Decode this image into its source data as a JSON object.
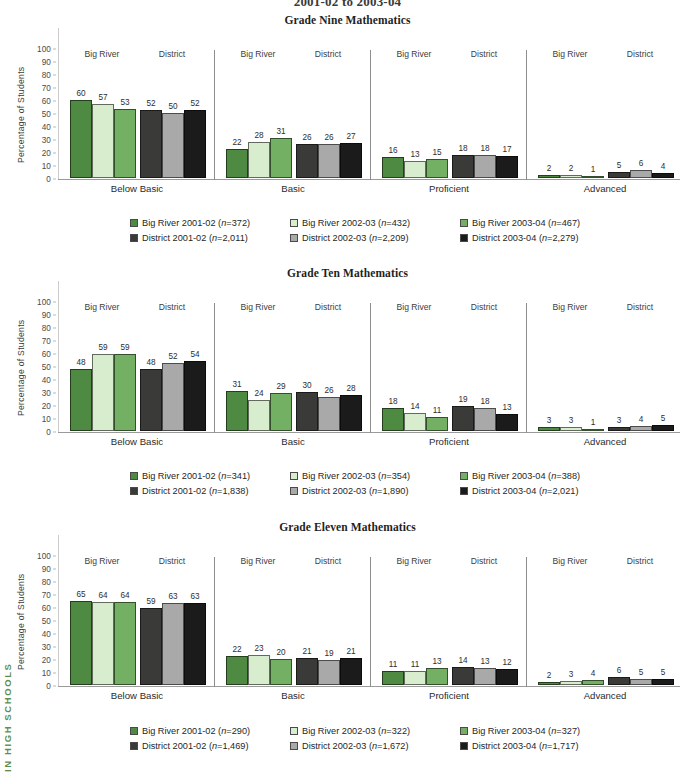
{
  "page": {
    "top_title": "2001-02 to 2003-04",
    "running_head": "IN HIGH SCHOOLS"
  },
  "series_defs": [
    {
      "key": "br0102",
      "label_prefix": "Big River 2001-02",
      "color": "#4e8a42"
    },
    {
      "key": "br0203",
      "label_prefix": "Big River 2002-03",
      "color": "#d8ecce"
    },
    {
      "key": "br0304",
      "label_prefix": "Big River 2003-04",
      "color": "#74b063"
    },
    {
      "key": "d0102",
      "label_prefix": "District 2001-02",
      "color": "#3a3a38"
    },
    {
      "key": "d0203",
      "label_prefix": "District 2002-03",
      "color": "#a9a9a9"
    },
    {
      "key": "d0304",
      "label_prefix": "District 2003-04",
      "color": "#1b1b1b"
    }
  ],
  "axis": {
    "ylabel": "Percentage of Students",
    "ticks": [
      "100",
      "90",
      "80",
      "70",
      "60",
      "50",
      "40",
      "30",
      "20",
      "10",
      "0"
    ],
    "ymin": 0,
    "ymax": 100
  },
  "group_headers": {
    "big_river": "Big River",
    "district": "District"
  },
  "categories": [
    "Below Basic",
    "Basic",
    "Proficient",
    "Advanced"
  ],
  "chart_data": [
    {
      "type": "bar",
      "title": "Grade Nine Mathematics",
      "xlabel": "",
      "ylabel": "Percentage of Students",
      "ylim": [
        0,
        100
      ],
      "grid": false,
      "legend_position": "bottom",
      "categories": [
        "Below Basic",
        "Basic",
        "Proficient",
        "Advanced"
      ],
      "series": [
        {
          "name": "Big River 2001-02 (n=372)",
          "n": "372",
          "values": [
            60,
            22,
            16,
            2
          ]
        },
        {
          "name": "Big River 2002-03 (n=432)",
          "n": "432",
          "values": [
            57,
            28,
            13,
            2
          ]
        },
        {
          "name": "Big River 2003-04 (n=467)",
          "n": "467",
          "values": [
            53,
            31,
            15,
            1
          ]
        },
        {
          "name": "District 2001-02 (n=2,011)",
          "n": "2,011",
          "values": [
            52,
            26,
            18,
            5
          ]
        },
        {
          "name": "District 2002-03 (n=2,209)",
          "n": "2,209",
          "values": [
            50,
            26,
            18,
            6
          ]
        },
        {
          "name": "District 2003-04 (n=2,279)",
          "n": "2,279",
          "values": [
            52,
            27,
            17,
            4
          ]
        }
      ],
      "legend": [
        {
          "label_prefix": "Big River 2001-02",
          "n": "372",
          "color": "#4e8a42"
        },
        {
          "label_prefix": "Big River 2002-03",
          "n": "432",
          "color": "#d8ecce"
        },
        {
          "label_prefix": "Big River 2003-04",
          "n": "467",
          "color": "#74b063"
        },
        {
          "label_prefix": "District 2001-02",
          "n": "2,011",
          "color": "#3a3a38"
        },
        {
          "label_prefix": "District 2002-03",
          "n": "2,209",
          "color": "#a9a9a9"
        },
        {
          "label_prefix": "District 2003-04",
          "n": "2,279",
          "color": "#1b1b1b"
        }
      ]
    },
    {
      "type": "bar",
      "title": "Grade Ten Mathematics",
      "xlabel": "",
      "ylabel": "Percentage of Students",
      "ylim": [
        0,
        100
      ],
      "grid": false,
      "legend_position": "bottom",
      "categories": [
        "Below Basic",
        "Basic",
        "Proficient",
        "Advanced"
      ],
      "series": [
        {
          "name": "Big River 2001-02 (n=341)",
          "n": "341",
          "values": [
            48,
            31,
            18,
            3
          ]
        },
        {
          "name": "Big River 2002-03 (n=354)",
          "n": "354",
          "values": [
            59,
            24,
            14,
            3
          ]
        },
        {
          "name": "Big River 2003-04 (n=388)",
          "n": "388",
          "values": [
            59,
            29,
            11,
            1
          ]
        },
        {
          "name": "District 2001-02 (n=1,838)",
          "n": "1,838",
          "values": [
            48,
            30,
            19,
            3
          ]
        },
        {
          "name": "District 2002-03 (n=1,890)",
          "n": "1,890",
          "values": [
            52,
            26,
            18,
            4
          ]
        },
        {
          "name": "District 2003-04 (n=2,021)",
          "n": "2,021",
          "values": [
            54,
            28,
            13,
            5
          ]
        }
      ],
      "legend": [
        {
          "label_prefix": "Big River 2001-02",
          "n": "341",
          "color": "#4e8a42"
        },
        {
          "label_prefix": "Big River 2002-03",
          "n": "354",
          "color": "#d8ecce"
        },
        {
          "label_prefix": "Big River 2003-04",
          "n": "388",
          "color": "#74b063"
        },
        {
          "label_prefix": "District 2001-02",
          "n": "1,838",
          "color": "#3a3a38"
        },
        {
          "label_prefix": "District 2002-03",
          "n": "1,890",
          "color": "#a9a9a9"
        },
        {
          "label_prefix": "District 2003-04",
          "n": "2,021",
          "color": "#1b1b1b"
        }
      ]
    },
    {
      "type": "bar",
      "title": "Grade Eleven Mathematics",
      "xlabel": "",
      "ylabel": "Percentage of Students",
      "ylim": [
        0,
        100
      ],
      "grid": false,
      "legend_position": "bottom",
      "categories": [
        "Below Basic",
        "Basic",
        "Proficient",
        "Advanced"
      ],
      "series": [
        {
          "name": "Big River 2001-02 (n=290)",
          "n": "290",
          "values": [
            65,
            22,
            11,
            2
          ]
        },
        {
          "name": "Big River 2002-03 (n=322)",
          "n": "322",
          "values": [
            64,
            23,
            11,
            3
          ]
        },
        {
          "name": "Big River 2003-04 (n=327)",
          "n": "327",
          "values": [
            64,
            20,
            13,
            4
          ]
        },
        {
          "name": "District 2001-02 (n=1,469)",
          "n": "1,469",
          "values": [
            59,
            21,
            14,
            6
          ]
        },
        {
          "name": "District 2002-03 (n=1,672)",
          "n": "1,672",
          "values": [
            63,
            19,
            13,
            5
          ]
        },
        {
          "name": "District 2003-04 (n=1,717)",
          "n": "1,717",
          "values": [
            63,
            21,
            12,
            5
          ]
        }
      ],
      "legend": [
        {
          "label_prefix": "Big River 2001-02",
          "n": "290",
          "color": "#4e8a42"
        },
        {
          "label_prefix": "Big River 2002-03",
          "n": "322",
          "color": "#d8ecce"
        },
        {
          "label_prefix": "Big River 2003-04",
          "n": "327",
          "color": "#74b063"
        },
        {
          "label_prefix": "District 2001-02",
          "n": "1,469",
          "color": "#3a3a38"
        },
        {
          "label_prefix": "District 2002-03",
          "n": "1,672",
          "color": "#a9a9a9"
        },
        {
          "label_prefix": "District 2003-04",
          "n": "1,717",
          "color": "#1b1b1b"
        }
      ]
    }
  ]
}
